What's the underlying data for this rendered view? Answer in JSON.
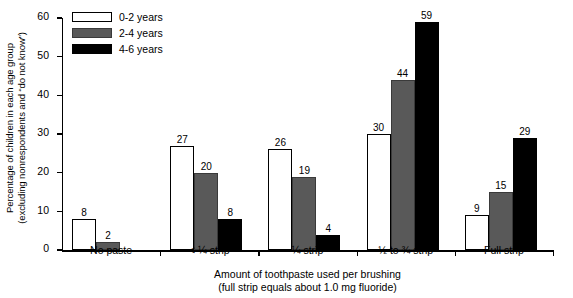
{
  "chart_data": {
    "type": "bar",
    "title": "",
    "categories": [
      "No paste",
      "< ¼ strip",
      "¼ strip",
      "½ to ¾ strip",
      "Full strip"
    ],
    "series": [
      {
        "name": "0-2 years",
        "color": "#ffffff",
        "values": [
          8,
          27,
          26,
          30,
          9
        ]
      },
      {
        "name": "2-4 years",
        "color": "#595959",
        "values": [
          2,
          20,
          19,
          44,
          15
        ]
      },
      {
        "name": "4-6 years",
        "color": "#000000",
        "values": [
          null,
          8,
          4,
          59,
          29
        ]
      }
    ],
    "ylabel_line1": "Percentage of children in each age group",
    "ylabel_line2": "(excluding nonrespondents and “do not know”)",
    "xlabel_line1": "Amount of toothpaste used per brushing",
    "xlabel_line2": "(full strip equals about 1.0 mg fluoride)",
    "ylim": [
      0,
      60
    ],
    "yticks": [
      0,
      10,
      20,
      30,
      40,
      50,
      60
    ],
    "ytick_labels": [
      "0",
      "10",
      "20",
      "30",
      "40",
      "50",
      "60"
    ],
    "grid": false,
    "legend_position": "top-left"
  },
  "legend": {
    "items": [
      {
        "label": "0-2 years",
        "swatch": "white-swatch"
      },
      {
        "label": "2-4 years",
        "swatch": "gray-swatch"
      },
      {
        "label": "4-6 years",
        "swatch": "black-swatch"
      }
    ]
  },
  "axes": {
    "y_title_l1": "Percentage of children in each age group",
    "y_title_l2": "(excluding nonrespondents and “do not know”)",
    "x_title_l1": "Amount of toothpaste used per brushing",
    "x_title_l2": "(full strip equals about 1.0 mg fluoride)"
  }
}
